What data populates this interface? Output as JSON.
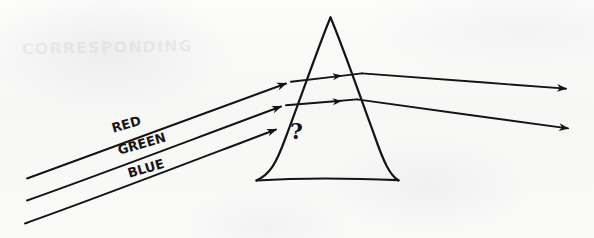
{
  "figure": {
    "kind": "hand-drawn-physics-sketch",
    "media": "black-ink-on-white-paper",
    "canvas": {
      "width": 594,
      "height": 238
    },
    "ink_color": "#141416",
    "paper_color": "#fbfbfa",
    "ghost_ink_color": "#787a80"
  },
  "ghost": {
    "bleedthrough_text": "CORRESPONDING",
    "note_visible": "very faint show-through from reverse side of paper"
  },
  "prism": {
    "name": "triangular-prism",
    "apex": {
      "x": 330,
      "y": 17
    },
    "base_left": {
      "x": 256,
      "y": 180
    },
    "base_right": {
      "x": 398,
      "y": 180
    },
    "stroke_width": 2.1
  },
  "labels": [
    {
      "id": "red",
      "text": "RED",
      "x": 112,
      "y": 128,
      "rotation": -16,
      "font_size": 13
    },
    {
      "id": "green",
      "text": "GREEN",
      "x": 118,
      "y": 150,
      "rotation": -16,
      "font_size": 13
    },
    {
      "id": "blue",
      "text": "BLUE",
      "x": 128,
      "y": 173,
      "rotation": -16,
      "font_size": 13
    }
  ],
  "unknown": {
    "text": "?",
    "x": 290,
    "y": 118,
    "font_size": 22,
    "meaning": "path of blue ray inside prism is unknown"
  },
  "rays": {
    "incoming": [
      {
        "id": "incoming-red",
        "label": "RED",
        "from": {
          "x": 27,
          "y": 178
        },
        "to": {
          "x": 291,
          "y": 82
        },
        "arrow_at_end": true
      },
      {
        "id": "incoming-green",
        "label": "GREEN",
        "from": {
          "x": 27,
          "y": 200
        },
        "to": {
          "x": 286,
          "y": 105
        },
        "arrow_at_end": true
      },
      {
        "id": "incoming-blue",
        "label": "BLUE",
        "from": {
          "x": 25,
          "y": 223
        },
        "to": {
          "x": 281,
          "y": 128
        },
        "arrow_at_end": true
      }
    ],
    "internal": [
      {
        "id": "internal-red",
        "from": {
          "x": 291,
          "y": 82
        },
        "to": {
          "x": 361,
          "y": 73
        },
        "arrow_at": {
          "x": 339,
          "y": 75
        }
      },
      {
        "id": "internal-green",
        "from": {
          "x": 286,
          "y": 105
        },
        "to": {
          "x": 356,
          "y": 99
        },
        "arrow_at": {
          "x": 338,
          "y": 100
        }
      }
    ],
    "outgoing": [
      {
        "id": "outgoing-upper",
        "from": {
          "x": 361,
          "y": 73
        },
        "to": {
          "x": 572,
          "y": 89
        },
        "arrow_at_end": true
      },
      {
        "id": "outgoing-lower",
        "from": {
          "x": 356,
          "y": 99
        },
        "to": {
          "x": 574,
          "y": 129
        },
        "arrow_at_end": true
      }
    ],
    "blue_internal_path": {
      "drawn": false,
      "note": "terminates at left prism face; continuation marked with question mark"
    }
  }
}
